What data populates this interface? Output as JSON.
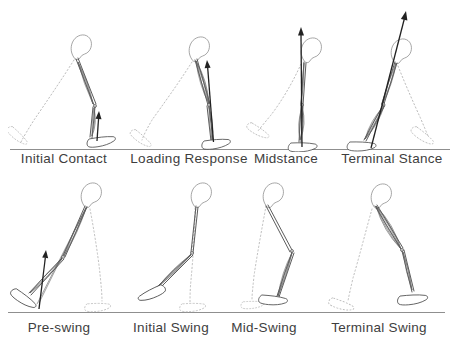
{
  "figure": {
    "colors": {
      "background": "#ffffff",
      "line": "#4a4a4a",
      "bone": "#8a8a8a",
      "muscle": "#5f5f5f",
      "ghost": "#bdbdbd",
      "ground": "#8f8f8f",
      "arrow": "#222222",
      "label": "#3e3e3e"
    },
    "icons": {
      "force-arrow": "↑ ground reaction force vector",
      "ghost-leg": "dotted contralateral leg",
      "pelvis-bone": "hip bone outline",
      "muscle-bundle": "hatched muscle spindle"
    }
  },
  "rows": [
    {
      "name": "stance-phases",
      "phases": [
        {
          "label": "Initial Contact",
          "force_arrow": true
        },
        {
          "label": "Loading Response",
          "force_arrow": true
        },
        {
          "label": "Midstance",
          "force_arrow": true
        },
        {
          "label": "Terminal Stance",
          "force_arrow": true
        }
      ]
    },
    {
      "name": "swing-phases",
      "phases": [
        {
          "label": "Pre-swing",
          "force_arrow": true
        },
        {
          "label": "Initial Swing",
          "force_arrow": false
        },
        {
          "label": "Mid-Swing",
          "force_arrow": false
        },
        {
          "label": "Terminal Swing",
          "force_arrow": false
        }
      ]
    }
  ]
}
